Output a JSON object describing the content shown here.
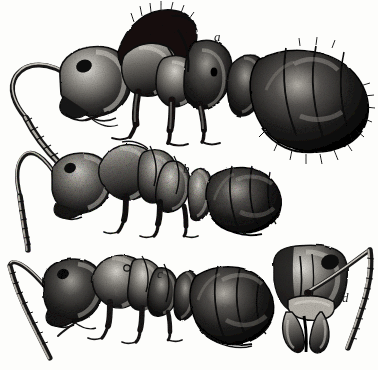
{
  "plate": {
    "kind": "scientific-illustration",
    "medium": "engraving-halftone",
    "background_color": "#fdfdfb",
    "ink_color": "#111111",
    "width": 378,
    "height": 370,
    "subject": "ants",
    "figure_count": 4
  },
  "figures": [
    {
      "id": "a",
      "label": "a",
      "label_x": 214,
      "label_y": 30,
      "view": "lateral",
      "description": "large ant in left-facing profile with long curved antenna, dark head, segmented alitrunk, and large ovoid gaster",
      "parts": [
        "antenna",
        "head",
        "mandible",
        "alitrunk",
        "legs",
        "petiole",
        "gaster"
      ]
    },
    {
      "id": "b",
      "label": "b",
      "label_x": 183,
      "label_y": 162,
      "view": "lateral",
      "description": "medium ant in left-facing profile with curved antenna, rounded head, nodiform petiole scale, and banded gaster",
      "parts": [
        "antenna",
        "head",
        "alitrunk",
        "legs",
        "petiole-scale",
        "gaster"
      ]
    },
    {
      "id": "c",
      "label": "c",
      "label_x": 157,
      "label_y": 267,
      "view": "lateral",
      "description": "smaller ant in left-facing profile with long antenna sweeping down-left, compact head, and striated gaster",
      "parts": [
        "antenna",
        "head",
        "mandible",
        "alitrunk",
        "legs",
        "petiole",
        "gaster"
      ]
    },
    {
      "id": "d",
      "label": "d",
      "label_x": 342,
      "label_y": 291,
      "view": "frontal-head",
      "description": "frontal view of an ant head showing compound eye, clypeus, paired mandibles and one antenna extending upward to the right",
      "parts": [
        "head-capsule",
        "eye",
        "clypeus",
        "mandibles",
        "antenna"
      ]
    }
  ]
}
